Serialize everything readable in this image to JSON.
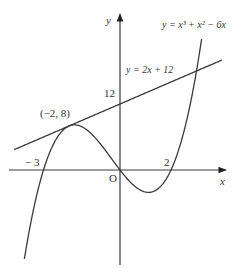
{
  "diagram": {
    "type": "function-graph",
    "axes": {
      "x_label": "x",
      "y_label": "y",
      "origin_label": "O"
    },
    "curves": [
      {
        "name": "cubic",
        "equation": "y = x³ + x² − 6x",
        "label": "y = x³ + x² − 6x",
        "x_range": [
          -3.75,
          3.2
        ]
      },
      {
        "name": "line",
        "equation": "y = 2x + 12",
        "label": "y = 2x + 12",
        "x_range": [
          -4.15,
          4.0
        ]
      }
    ],
    "annotations": {
      "tangent_point": "(−2, 8)",
      "y_intercept": "12",
      "root_neg3": "− 3",
      "root_2": "2"
    },
    "colors": {
      "stroke": "#3a3a3a",
      "text": "#333333"
    }
  }
}
